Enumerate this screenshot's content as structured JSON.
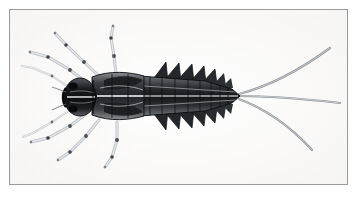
{
  "plate": {
    "background_color": "#ffffff",
    "frame": {
      "border_color": "#9a9a9a",
      "fill_color": "#fefefe",
      "x": 9,
      "y": 9,
      "width": 339,
      "height": 176
    },
    "caption": "",
    "label": ""
  },
  "illustration": {
    "subject": "mayfly-nymph-dorsal-view",
    "technique": "engraving",
    "palette": {
      "ink_darkest": "#17181a",
      "ink_dark": "#2e3033",
      "ink_mid": "#5d6166",
      "ink_light": "#9ba0a6",
      "ink_faint": "#c8ccd1",
      "paper": "#fdfdfc"
    },
    "body_axis": {
      "head_center_x": 80,
      "head_center_y": 98,
      "abdomen_tip_x": 239,
      "abdomen_tip_y": 96
    },
    "parts": {
      "head": {
        "name": "head-capsule",
        "cx": 80,
        "cy": 98,
        "rx": 14,
        "ry": 17,
        "tone": "#1b1d20"
      },
      "eyes": {
        "name": "compound-eyes",
        "count": 2,
        "tone": "#0f1012"
      },
      "thorax": {
        "name": "thorax",
        "x": 93,
        "y": 77,
        "width": 52,
        "height": 42,
        "tone": "#3a3d41"
      },
      "wing_pads": {
        "name": "wing-pads",
        "count": 2,
        "tone": "#26282b"
      },
      "abdomen": {
        "name": "abdomen",
        "segment_count": 10,
        "start_x": 143,
        "end_x": 239,
        "tone": "#4a4e53"
      },
      "gills": {
        "name": "lateral-gill-plates",
        "pairs": 7,
        "shape": "triangular",
        "tone": "#1f2124"
      },
      "legs": {
        "name": "legs",
        "count": 6,
        "segments_each": 3,
        "tone": "#b3b8bd",
        "joint_tone": "#4b4f54"
      },
      "antennae": {
        "name": "antennae",
        "count": 2,
        "tone": "#b8bdc2"
      },
      "cerci": {
        "name": "caudal-filaments",
        "count": 3,
        "tone": "#6e7378",
        "origin_x": 239,
        "origin_y": 96
      }
    }
  }
}
